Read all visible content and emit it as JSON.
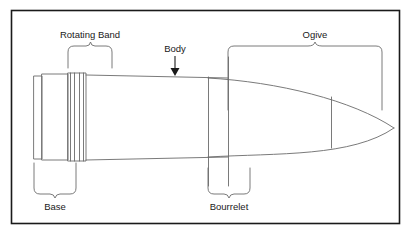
{
  "figure": {
    "type": "technical-line-drawing",
    "border_color": "#1a1a1a",
    "line_color": "#6b6b6b",
    "text_color": "#1a1a1a",
    "background_color": "#ffffff",
    "frame": {
      "x": 11,
      "y": 10,
      "width": 389,
      "height": 214
    }
  },
  "labels": {
    "rotating_band": "Rotating Band",
    "body": "Body",
    "ogive": "Ogive",
    "base": "Base",
    "bourrelet": "Bourrelet"
  },
  "callouts": [
    {
      "name": "rotating-band",
      "label": "Rotating Band",
      "style": "brace-below",
      "text_x": 107,
      "text_y": 36,
      "anchor": "middle",
      "span_x1": 68,
      "span_x2": 111,
      "brace_y": 46,
      "brace_depth": 22
    },
    {
      "name": "body",
      "label": "Body",
      "style": "arrow-down",
      "text_x": 175,
      "text_y": 52,
      "anchor": "middle",
      "arrow_x": 175,
      "arrow_y1": 56,
      "arrow_y2": 74
    },
    {
      "name": "ogive",
      "label": "Ogive",
      "style": "brace-below",
      "text_x": 316,
      "text_y": 36,
      "anchor": "middle",
      "span_x1": 228,
      "span_x2": 382,
      "brace_y": 46,
      "brace_depth": 18
    },
    {
      "name": "base",
      "label": "Base",
      "style": "brace-above",
      "text_x": 55,
      "text_y": 208,
      "anchor": "middle",
      "span_x1": 34,
      "span_x2": 76,
      "brace_y": 194,
      "brace_depth": 32
    },
    {
      "name": "bourrelet",
      "label": "Bourrelet",
      "style": "brace-above",
      "text_x": 229,
      "text_y": 208,
      "anchor": "middle",
      "span_x1": 208,
      "span_x2": 250,
      "brace_y": 194,
      "brace_depth": 34
    }
  ],
  "projectile": {
    "parts": [
      {
        "name": "base-rear-plate",
        "kind": "rect",
        "x": 34,
        "y": 76,
        "width": 8,
        "height": 83
      },
      {
        "name": "base-body",
        "kind": "rect",
        "x": 42,
        "y": 74,
        "width": 26,
        "height": 86
      },
      {
        "name": "rotating-band-groove-1",
        "kind": "vline",
        "x": 70,
        "y1": 73,
        "y2": 161
      },
      {
        "name": "rotating-band-groove-2",
        "kind": "vline",
        "x": 74,
        "y1": 73,
        "y2": 161
      },
      {
        "name": "rotating-band-groove-3",
        "kind": "vline",
        "x": 79,
        "y1": 73,
        "y2": 161
      },
      {
        "name": "rotating-band-groove-4",
        "kind": "vline",
        "x": 83,
        "y1": 73,
        "y2": 161
      },
      {
        "name": "band-seat-rect",
        "kind": "rect",
        "x": 68,
        "y": 73,
        "width": 18,
        "height": 88
      },
      {
        "name": "body-upper-line",
        "kind": "line",
        "x1": 86,
        "y1": 75,
        "x2": 208,
        "y2": 77
      },
      {
        "name": "body-lower-line",
        "kind": "line",
        "x2": 208,
        "y2": 158,
        "x1": 86,
        "y1": 160
      },
      {
        "name": "bourrelet-line-left",
        "kind": "vline",
        "x": 208,
        "y1": 76,
        "y2": 186
      },
      {
        "name": "bourrelet-line-right",
        "kind": "vline",
        "x": 228,
        "y1": 57,
        "y2": 186
      },
      {
        "name": "ogive-upper-curve",
        "kind": "curve",
        "from": [
          208,
          77
        ],
        "to": [
          394,
          128
        ]
      },
      {
        "name": "ogive-lower-curve",
        "kind": "curve",
        "from": [
          208,
          158
        ],
        "to": [
          394,
          128
        ]
      },
      {
        "name": "nose-tip",
        "kind": "point",
        "x": 394,
        "y": 128
      },
      {
        "name": "ogive-section-line",
        "kind": "vline",
        "x": 331,
        "y1": 96,
        "y2": 148
      }
    ]
  }
}
